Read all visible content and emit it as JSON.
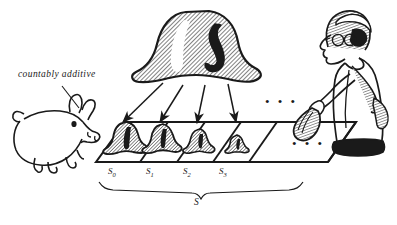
{
  "figure": {
    "background_color": "#ffffff",
    "ink_color": "#1a1a1a",
    "annotation": "countably additive",
    "big_measure": {
      "name": "big-bell-shape",
      "fill": "hatched",
      "mark": "dark-comma-mark"
    },
    "arrow_count": 4,
    "ellipsis_top": "• • •",
    "ellipsis_table": "• • •",
    "cells": [
      {
        "label": "S",
        "sub": "0"
      },
      {
        "label": "S",
        "sub": "1"
      },
      {
        "label": "S",
        "sub": "2"
      },
      {
        "label": "S",
        "sub": "3"
      }
    ],
    "brace_label": "S",
    "pig": {
      "name": "pig-figure"
    },
    "person": {
      "name": "person-with-trowel"
    }
  }
}
